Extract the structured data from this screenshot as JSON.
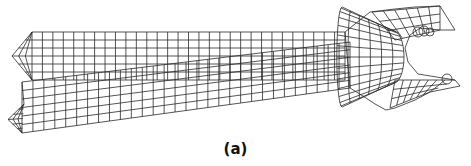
{
  "figure": {
    "caption": "(a)",
    "line_color": "#2a2a2a",
    "background": "#ffffff"
  },
  "mesh": {
    "upper_arm": {
      "x0": 32,
      "x1": 345,
      "y_top": 32,
      "y_bot": 80,
      "cols": 30,
      "rows": 6,
      "tip_x": 12
    },
    "lower_arm": {
      "x0": 22,
      "x1": 350,
      "y_top_left": 82,
      "y_bot_left": 133,
      "y_top_right": 42,
      "y_bot_right": 88,
      "cols": 30,
      "rows": 6,
      "tip_x": 8
    },
    "head": {
      "label": "jaw-head"
    },
    "contact_circles": 4
  }
}
